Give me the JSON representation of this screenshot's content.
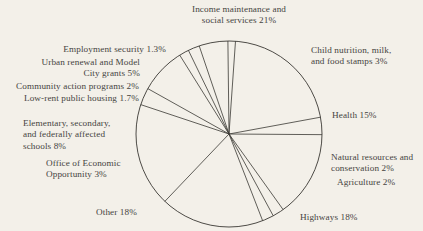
{
  "chart_data": {
    "type": "pie",
    "title": "",
    "subtitle": "",
    "xlabel": "",
    "ylabel": "",
    "legend_position": "none",
    "grid": false,
    "labels_inline": true,
    "units": "percent",
    "center": [
      229,
      134
    ],
    "radius": 93,
    "start_angle_deg": -86,
    "direction": "clockwise",
    "stroke_color": "#3a3833",
    "fill_color": "#f3f0e9",
    "background": "#f3f0e9",
    "text_color": "#46443f",
    "categories": [
      "Income maintenance and social services",
      "Child nutrition, milk, and food stamps",
      "Health",
      "Natural resources and conservation",
      "Agriculture",
      "Highways",
      "Other",
      "Office of Economic Opportunity",
      "Elementary, secondary, and federally affected schools",
      "Low-rent public housing",
      "Community action programs",
      "Urban renewal and Model City grants",
      "Employment security"
    ],
    "values": [
      21,
      3,
      15,
      2,
      2,
      18,
      18,
      3,
      8,
      1.7,
      2,
      5,
      1.3
    ],
    "slices": [
      {
        "label": "Income maintenance and social services",
        "value": 21,
        "display": "21%"
      },
      {
        "label": "Child nutrition, milk, and food stamps",
        "value": 3,
        "display": "3%"
      },
      {
        "label": "Health",
        "value": 15,
        "display": "15%"
      },
      {
        "label": "Natural resources and conservation",
        "value": 2,
        "display": "2%"
      },
      {
        "label": "Agriculture",
        "value": 2,
        "display": "2%"
      },
      {
        "label": "Highways",
        "value": 18,
        "display": "18%"
      },
      {
        "label": "Other",
        "value": 18,
        "display": "18%"
      },
      {
        "label": "Office of Economic Opportunity",
        "value": 3,
        "display": "3%"
      },
      {
        "label": "Elementary, secondary, and federally affected schools",
        "value": 8,
        "display": "8%"
      },
      {
        "label": "Low-rent public housing",
        "value": 1.7,
        "display": "1.7%"
      },
      {
        "label": "Community action programs",
        "value": 2,
        "display": "2%"
      },
      {
        "label": "Urban renewal and Model City grants",
        "value": 5,
        "display": "5%"
      },
      {
        "label": "Employment security",
        "value": 1.3,
        "display": "1.3%"
      }
    ]
  },
  "labels": {
    "income": "Income maintenance and\nsocial services 21%",
    "child_nutrition": "Child nutrition, milk,\nand food stamps 3%",
    "health": "Health 15%",
    "natural_resources": "Natural resources and\nconservation 2%",
    "agriculture": "Agriculture 2%",
    "highways": "Highways 18%",
    "other": "Other 18%",
    "oeo": "Office of Economic\nOpportunity 3%",
    "schools": "Elementary, secondary,\nand federally affected\nschools 8%",
    "low_rent": "Low-rent public housing 1.7%",
    "community_action": "Community action programs 2%",
    "urban_renewal": "Urban renewal and Model\nCity grants 5%",
    "employment_security": "Employment security 1.3%"
  }
}
